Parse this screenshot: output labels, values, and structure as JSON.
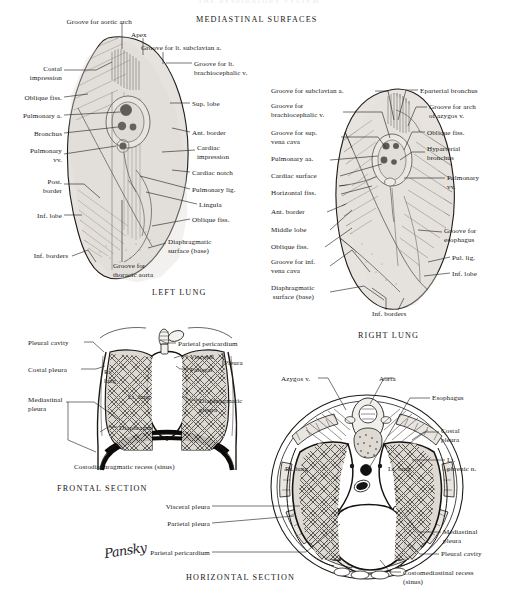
{
  "page": {
    "running_head": "THE RESPIRATORY SYSTEM",
    "background": "#ffffff",
    "ink": "#171717",
    "signature": "Pansky"
  },
  "headings": {
    "mediastinal_surfaces": "MEDIASTINAL SURFACES",
    "left_lung": "LEFT LUNG",
    "right_lung": "RIGHT LUNG",
    "frontal_section": "FRONTAL SECTION",
    "horizontal_section": "HORIZONTAL SECTION"
  },
  "figures": {
    "left_lung": {
      "title": "LEFT LUNG",
      "labels_left": [
        {
          "id": "groove-aortic-arch",
          "text": "Groove for aortic arch"
        },
        {
          "id": "costal-impression",
          "text": "Costal\nimpression"
        },
        {
          "id": "oblique-fiss-upper",
          "text": "Oblique fiss."
        },
        {
          "id": "pulmonary-a",
          "text": "Pulmonary a."
        },
        {
          "id": "bronchus",
          "text": "Bronchus"
        },
        {
          "id": "pulmonary-vv",
          "text": "Pulmonary\nvv."
        },
        {
          "id": "post-border",
          "text": "Post.\nborder"
        },
        {
          "id": "inf-lobe",
          "text": "Inf. lobe"
        },
        {
          "id": "inf-borders",
          "text": "Inf. borders"
        }
      ],
      "labels_top": [
        {
          "id": "apex",
          "text": "Apex"
        },
        {
          "id": "groove-lt-subclavian-a",
          "text": "Groove for lt. subclavian a."
        },
        {
          "id": "groove-lt-brachiocephalic-v",
          "text": "Groove for lt.\nbrachiocephalic v."
        }
      ],
      "labels_right": [
        {
          "id": "sup-lobe",
          "text": "Sup. lobe"
        },
        {
          "id": "ant-border",
          "text": "Ant. border"
        },
        {
          "id": "cardiac-impression",
          "text": "Cardiac\nimpression"
        },
        {
          "id": "cardiac-notch",
          "text": "Cardiac notch"
        },
        {
          "id": "pulmonary-lig",
          "text": "Pulmonary lig."
        },
        {
          "id": "lingula",
          "text": "Lingula"
        },
        {
          "id": "oblique-fiss-lower",
          "text": "Oblique fiss."
        },
        {
          "id": "diaphragmatic-surface",
          "text": "Diaphragmatic\nsurface (base)"
        }
      ],
      "labels_bottom": [
        {
          "id": "groove-thoracic-aorta",
          "text": "Groove for\nthoracic aorta"
        }
      ]
    },
    "right_lung": {
      "title": "RIGHT LUNG",
      "labels_left": [
        {
          "id": "groove-subclavian-a",
          "text": "Groove for subclavian a."
        },
        {
          "id": "groove-brachiocephalic-v",
          "text": "Groove for\nbrachiocephalic v."
        },
        {
          "id": "groove-sup-vena-cava",
          "text": "Groove for sup.\nvena cava"
        },
        {
          "id": "pulmonary-aa",
          "text": "Pulmonary aa."
        },
        {
          "id": "cardiac-surface",
          "text": "Cardiac surface"
        },
        {
          "id": "horizontal-fiss",
          "text": "Horizontal fiss."
        },
        {
          "id": "ant-border",
          "text": "Ant. border"
        },
        {
          "id": "middle-lobe",
          "text": "Middle lobe"
        },
        {
          "id": "oblique-fiss",
          "text": "Oblique fiss."
        },
        {
          "id": "groove-inf-vena-cava",
          "text": "Groove for inf.\nvena cava"
        },
        {
          "id": "diaphragmatic-surface",
          "text": "Diaphragmatic\n surface (base)"
        }
      ],
      "labels_right": [
        {
          "id": "eparterial-bronchus",
          "text": "Eparterial bronchus"
        },
        {
          "id": "groove-arch-azygos",
          "text": "Groove for arch\nof azygos v."
        },
        {
          "id": "oblique-fiss-upper",
          "text": "Oblique fiss."
        },
        {
          "id": "hyparterial-bronchus",
          "text": "Hyparterial\nbronchus"
        },
        {
          "id": "pulmonary-vv",
          "text": "Pulmonary\nvv."
        },
        {
          "id": "groove-esophagus",
          "text": "Groove for\nesophagus"
        },
        {
          "id": "pul-lig",
          "text": "Pul. lig."
        },
        {
          "id": "inf-lobe",
          "text": "Inf. lobe"
        }
      ],
      "labels_bottom": [
        {
          "id": "inf-borders",
          "text": "Inf. borders"
        }
      ]
    },
    "frontal_section": {
      "title": "FRONTAL SECTION",
      "labels_left": [
        {
          "id": "pleural-cavity",
          "text": "Pleural cavity"
        },
        {
          "id": "costal-pleura",
          "text": "Costal pleura"
        },
        {
          "id": "mediastinal-pleura",
          "text": "Mediastinal\npleura"
        }
      ],
      "labels_right": [
        {
          "id": "parietal-pericardium",
          "text": "Parietal pericardium"
        },
        {
          "id": "visceral",
          "text": "Visceral"
        },
        {
          "id": "parietal",
          "text": "Parietal"
        },
        {
          "id": "pleura-brace",
          "text": "Pleura"
        },
        {
          "id": "diaphragmatic-pleura",
          "text": "Diaphragmatic\npleura"
        }
      ],
      "labels_inner": [
        {
          "id": "rt-lung",
          "text": "Rt.\nlung"
        },
        {
          "id": "lt-lung",
          "text": "Lt. lung"
        },
        {
          "id": "diaphragm",
          "text": "Diaphragm"
        }
      ],
      "labels_bottom": [
        {
          "id": "costodiaphragmatic-recess",
          "text": "Costodiaphragmatic recess (sinus)"
        }
      ]
    },
    "horizontal_section": {
      "title": "HORIZONTAL SECTION",
      "labels_top": [
        {
          "id": "azygos-v",
          "text": "Azygos v."
        },
        {
          "id": "aorta",
          "text": "Aorta"
        }
      ],
      "labels_left": [
        {
          "id": "visceral-pleura",
          "text": "Visceral pleura"
        },
        {
          "id": "parietal-pleura",
          "text": "Parietal pleura"
        },
        {
          "id": "parietal-pericardium",
          "text": "Parietal pericardium"
        }
      ],
      "labels_right": [
        {
          "id": "esophagus",
          "text": "Esophagus"
        },
        {
          "id": "costal-pleura",
          "text": "Costal\npleura"
        },
        {
          "id": "lt-phrenic-n",
          "text": "Lt.\nphrenic n."
        },
        {
          "id": "mediastinal-pleura",
          "text": "Mediastinal\npleura"
        },
        {
          "id": "pleural-cavity",
          "text": "Pleural cavity"
        },
        {
          "id": "costomediastinal-recess",
          "text": "Costomediastinal recess\n(sinus)"
        }
      ],
      "labels_inner": [
        {
          "id": "rt-lung",
          "text": "Rt. lung"
        },
        {
          "id": "lt-lung",
          "text": "Lt. lung"
        }
      ]
    }
  }
}
